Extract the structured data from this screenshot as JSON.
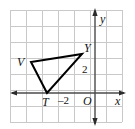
{
  "figure": {
    "type": "coordinate-plane-triangle",
    "width": 135,
    "height": 129,
    "background": "#ffffff",
    "grid": {
      "visible": true,
      "color": "#c9c9c9",
      "spacing_px": 16,
      "left_px": 10,
      "top_px": 10,
      "right_px": 122,
      "bottom_px": 122
    },
    "axes": {
      "color": "#4a4a4a",
      "x_axis_y_px": 93,
      "y_axis_x_px": 95,
      "x_label": "x",
      "y_label": "y",
      "origin_label": "O",
      "arrows": [
        "left",
        "right",
        "up",
        "down"
      ]
    },
    "ticks": [
      {
        "label": "2",
        "axis": "y",
        "value": 2
      },
      {
        "label": "–2",
        "axis": "x",
        "value": -2
      }
    ],
    "shape": {
      "name": "triangle",
      "stroke": "#000000",
      "stroke_width_px": 2,
      "fill": "none",
      "vertices": [
        {
          "label": "T",
          "x_px": 47,
          "y_px": 93,
          "x": -3,
          "y": 0
        },
        {
          "label": "V",
          "x_px": 31,
          "y_px": 62,
          "x": -4,
          "y": 2
        },
        {
          "label": "Y",
          "x_px": 82,
          "y_px": 54,
          "x": -1,
          "y": 2.5
        }
      ]
    },
    "labels": {
      "V": "V",
      "T": "T",
      "Y": "Y",
      "two": "2",
      "minus_two": "–2",
      "origin": "O",
      "x": "x",
      "y": "y"
    }
  }
}
